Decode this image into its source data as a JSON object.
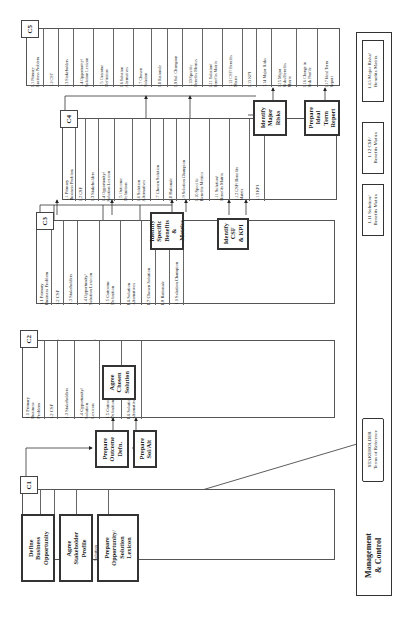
{
  "diagram": {
    "orientation": "rotated-90-ccw",
    "stacks": [
      {
        "id": "C1",
        "label": "C1",
        "cells": [
          "1.1 Primary\nBusiness\nProblem",
          "1.2 CSF",
          "1.3\nStakeholders",
          "1.4\nOpportunity/\nSolution\nLexicon"
        ]
      },
      {
        "id": "C2",
        "label": "C2",
        "cells": [
          "1.1 Primary\nBusiness\nProblem",
          "1.2 CSF",
          "1.3 Stakeholders",
          "1.4 Opportunity/\nSolution\nLexicon",
          "1.5 Outcome\nDefinition",
          "1.6 Solution\nAlternatives"
        ]
      },
      {
        "id": "C3",
        "label": "C3",
        "cells": [
          "1.1 Primary\nBusiness Problem",
          "1.2 CSF",
          "1.3 Stakeholders",
          "1.4 Opportunity/\nSolution Lexicon",
          "1.5 Outcome\nDefinition",
          "1.6 Solution\nAlternatives",
          "1.7 Chosen Solution",
          "1.8 Rationale",
          "1.9 Solution Champion"
        ]
      },
      {
        "id": "C4",
        "label": "C4",
        "cells": [
          "1.1 Primary\nBusiness Problem",
          "1.2 CSF",
          "1.3 Stakeholders",
          "1.4 Opportunity/\nSolution Lexicon",
          "1.5 Outcome\nDefinition",
          "1.6 Solution\nAlternatives",
          "1.7 Chosen Solution",
          "1.8 Rationale",
          "1.9 Solution Champion",
          "1.10 Specific\nBenefits Metrics",
          "1.11 Solution/\nBenefits Matrix",
          "1.12 CSF/ Benefits\nMatrix",
          "1.13 KPI"
        ]
      },
      {
        "id": "C5",
        "label": "C5",
        "cells": [
          "1.1 Primary\nBusiness Problem",
          "1.2 CSF",
          "1.3 Stakeholders",
          "1.4 Opportunity/\nSolution Lexicon",
          "1.5 Outcome\nDefinition",
          "1.6 Solution\nAlternatives",
          "1.7 Chosen\nSolution",
          "1.8 Rationale",
          "1.9 Sol. Champion",
          "1.10 Specific\nBenefits Metrics",
          "1.11 Solution/\nBenefits Matrix",
          "1.12 CSF/ Benefits\nMatrix",
          "1.13 KPI",
          "1.14 Major Risks",
          "1.15 Major\nRisks/Benefits\nMatrix",
          "1.16 Change in\nRisk Profile",
          "1.17 Ideal Term\nReport"
        ]
      }
    ],
    "processes": {
      "define_business_opportunity": "Define\nBusiness\nOpportunity",
      "agree_stakeholder_profile": "Agree\nStakeholder\nProfile",
      "prepare_opportunity_lexicon": "Prepare\nOpportunity/\nSolution\nLexicon",
      "prepare_outcome_defn": "Prepare\nOutcome\nDefn.",
      "prepare_sol_alt": "Prepare\nSol/Alt",
      "agree_chosen_solution": "Agree\nChosen\nSolution",
      "identify_specific_benefits": "Identify\nSpecific\nBenefits\n&\nMetrics",
      "identify_csf_kpi": "Identify\nCSF\n& KPI",
      "identify_major_risks": "Identify\nMajor\nRisks",
      "prepare_ideal_term_report": "Prepare\nIdeal\nTerm\nReport"
    },
    "management": {
      "title": "Management\n& Control",
      "docs": [
        "STAKEHOLDER\nTerms of Reference",
        "1.11 Solution/\nBenefits Matrix",
        "1.12 CSF/\nBenefits Matrix",
        "1.15 Major Risks/\nBenefits Matrix"
      ]
    }
  }
}
